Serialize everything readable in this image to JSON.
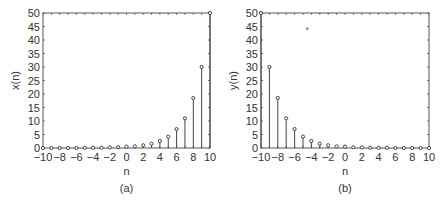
{
  "chart_data": [
    {
      "type": "stem",
      "caption": "(a)",
      "xlabel": "n",
      "ylabel": "x(n)",
      "xlim": [
        -10,
        10
      ],
      "ylim": [
        0,
        50
      ],
      "xticks": [
        -10,
        -8,
        -6,
        -4,
        -2,
        0,
        2,
        4,
        6,
        8,
        10
      ],
      "yticks": [
        0,
        5,
        10,
        15,
        20,
        25,
        30,
        35,
        40,
        45,
        50
      ],
      "x": [
        -10,
        -9,
        -8,
        -7,
        -6,
        -5,
        -4,
        -3,
        -2,
        -1,
        0,
        1,
        2,
        3,
        4,
        5,
        6,
        7,
        8,
        9,
        10
      ],
      "values": [
        0.0,
        0.0,
        0.0,
        0.0,
        0.0,
        0.1,
        0.1,
        0.1,
        0.2,
        0.3,
        0.5,
        0.6,
        1.0,
        1.6,
        2.6,
        4.2,
        7.0,
        11.0,
        18.5,
        30.0,
        50.0
      ],
      "annotations": []
    },
    {
      "type": "stem",
      "caption": "(b)",
      "xlabel": "n",
      "ylabel": "y(n)",
      "xlim": [
        -10,
        10
      ],
      "ylim": [
        0,
        50
      ],
      "xticks": [
        -10,
        -8,
        -6,
        -4,
        -2,
        0,
        2,
        4,
        6,
        8,
        10
      ],
      "yticks": [
        0,
        5,
        10,
        15,
        20,
        25,
        30,
        35,
        40,
        45,
        50
      ],
      "x": [
        -10,
        -9,
        -8,
        -7,
        -6,
        -5,
        -4,
        -3,
        -2,
        -1,
        0,
        1,
        2,
        3,
        4,
        5,
        6,
        7,
        8,
        9,
        10
      ],
      "values": [
        50.0,
        30.0,
        18.5,
        11.0,
        7.0,
        4.2,
        2.6,
        1.6,
        1.0,
        0.6,
        0.5,
        0.3,
        0.2,
        0.1,
        0.1,
        0.1,
        0.0,
        0.0,
        0.0,
        0.0,
        0.0
      ],
      "annotations": [
        {
          "text": "*",
          "x": -4.5,
          "y": 44
        }
      ]
    }
  ]
}
